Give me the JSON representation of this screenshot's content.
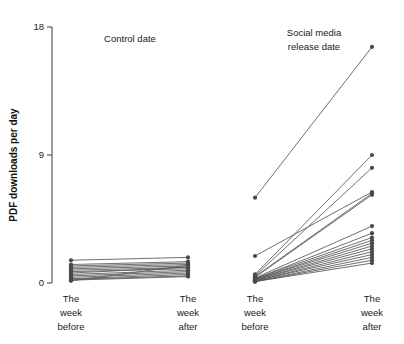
{
  "figure": {
    "y_axis_title": "PDF downloads per day",
    "y_ticks": [
      "0",
      "9",
      "18"
    ],
    "panels": [
      {
        "key": "control",
        "title": "Control date",
        "x_labels": [
          {
            "line1": "The",
            "line2": "week",
            "line3": "before"
          },
          {
            "line1": "The",
            "line2": "week",
            "line3": "after"
          }
        ]
      },
      {
        "key": "social",
        "title_line1": "Social media",
        "title_line2": "release date",
        "x_labels": [
          {
            "line1": "The",
            "line2": "week",
            "line3": "before"
          },
          {
            "line1": "The",
            "line2": "week",
            "line3": "after"
          }
        ]
      }
    ],
    "colors": {
      "line": "#555555",
      "point": "#4a4a4a",
      "axis": "#4d4d4a",
      "text": "#1a1a1a",
      "background": "#ffffff"
    }
  },
  "chart_data": {
    "type": "line",
    "title": "",
    "subtitle": "",
    "xlabel": "",
    "ylabel": "PDF downloads per day",
    "ylim": [
      0,
      18
    ],
    "yticks": [
      0,
      9,
      18
    ],
    "grid": false,
    "legend": "none",
    "style": "slopegraph / paired before-after lines, two facet panels",
    "x": [
      "The week before",
      "The week after"
    ],
    "panels": [
      {
        "name": "Control date",
        "categories": [
          "The week before",
          "The week after"
        ],
        "series": [
          {
            "name": "paper-01",
            "values": [
              1.6,
              1.8
            ]
          },
          {
            "name": "paper-02",
            "values": [
              1.3,
              1.5
            ]
          },
          {
            "name": "paper-03",
            "values": [
              1.2,
              1.4
            ]
          },
          {
            "name": "paper-04",
            "values": [
              1.1,
              1.3
            ]
          },
          {
            "name": "paper-05",
            "values": [
              1.0,
              1.2
            ]
          },
          {
            "name": "paper-06",
            "values": [
              0.9,
              1.1
            ]
          },
          {
            "name": "paper-07",
            "values": [
              0.8,
              1.0
            ]
          },
          {
            "name": "paper-08",
            "values": [
              0.7,
              1.1
            ]
          },
          {
            "name": "paper-09",
            "values": [
              0.6,
              0.9
            ]
          },
          {
            "name": "paper-10",
            "values": [
              0.5,
              0.8
            ]
          },
          {
            "name": "paper-11",
            "values": [
              0.4,
              0.7
            ]
          },
          {
            "name": "paper-12",
            "values": [
              0.3,
              0.6
            ]
          },
          {
            "name": "paper-13",
            "values": [
              0.25,
              0.5
            ]
          },
          {
            "name": "paper-14",
            "values": [
              0.2,
              0.45
            ]
          },
          {
            "name": "paper-15",
            "values": [
              0.15,
              1.25
            ]
          }
        ]
      },
      {
        "name": "Social media release date",
        "categories": [
          "The week before",
          "The week after"
        ],
        "series": [
          {
            "name": "paper-01",
            "values": [
              6.0,
              16.6
            ]
          },
          {
            "name": "paper-02",
            "values": [
              0.6,
              9.0
            ]
          },
          {
            "name": "paper-03",
            "values": [
              0.5,
              8.1
            ]
          },
          {
            "name": "paper-04",
            "values": [
              1.9,
              6.4
            ]
          },
          {
            "name": "paper-05",
            "values": [
              0.45,
              6.3
            ]
          },
          {
            "name": "paper-06",
            "values": [
              0.4,
              6.2
            ]
          },
          {
            "name": "paper-07",
            "values": [
              0.35,
              4.0
            ]
          },
          {
            "name": "paper-08",
            "values": [
              0.3,
              3.5
            ]
          },
          {
            "name": "paper-09",
            "values": [
              0.3,
              3.2
            ]
          },
          {
            "name": "paper-10",
            "values": [
              0.25,
              3.0
            ]
          },
          {
            "name": "paper-11",
            "values": [
              0.25,
              2.8
            ]
          },
          {
            "name": "paper-12",
            "values": [
              0.2,
              2.6
            ]
          },
          {
            "name": "paper-13",
            "values": [
              0.2,
              2.4
            ]
          },
          {
            "name": "paper-14",
            "values": [
              0.15,
              2.2
            ]
          },
          {
            "name": "paper-15",
            "values": [
              0.15,
              2.0
            ]
          },
          {
            "name": "paper-16",
            "values": [
              0.1,
              1.8
            ]
          },
          {
            "name": "paper-17",
            "values": [
              0.1,
              1.6
            ]
          },
          {
            "name": "paper-18",
            "values": [
              0.1,
              1.4
            ]
          }
        ]
      }
    ]
  }
}
